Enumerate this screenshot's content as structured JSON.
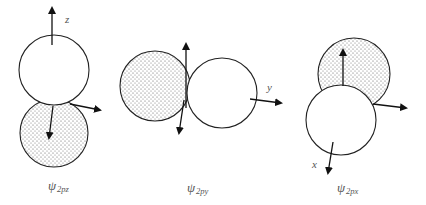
{
  "diagram": {
    "type": "p-orbital-lobes",
    "colors": {
      "stroke": "#222222",
      "fill_shaded": "#ffffff",
      "dots": "#555555",
      "label": "#555555",
      "background": "#ffffff"
    },
    "figures": [
      {
        "id": "psi-2pz",
        "caption": {
          "symbol": "ψ",
          "subscript": "2pz"
        },
        "axis_label": "z",
        "lobes": [
          {
            "cx": 54,
            "cy": 70,
            "r": 35,
            "shaded": false
          },
          {
            "cx": 54,
            "cy": 133,
            "r": 34,
            "shaded": true
          }
        ]
      },
      {
        "id": "psi-2py",
        "caption": {
          "symbol": "ψ",
          "subscript": "2py"
        },
        "axis_label": "y",
        "lobes": [
          {
            "cx": 155,
            "cy": 86,
            "r": 35,
            "shaded": true
          },
          {
            "cx": 222,
            "cy": 93,
            "r": 35,
            "shaded": false
          }
        ]
      },
      {
        "id": "psi-2px",
        "caption": {
          "symbol": "ψ",
          "subscript": "2px"
        },
        "axis_label": "x",
        "lobes": [
          {
            "cx": 354,
            "cy": 74,
            "r": 36,
            "shaded": true
          },
          {
            "cx": 341,
            "cy": 120,
            "r": 35,
            "shaded": false
          }
        ]
      }
    ]
  },
  "labels": {
    "fig1_axis": "z",
    "fig2_axis": "y",
    "fig3_axis": "x",
    "fig1_psi": "ψ",
    "fig1_sub": "2pz",
    "fig2_psi": "ψ",
    "fig2_sub": "2py",
    "fig3_psi": "ψ",
    "fig3_sub": "2px"
  }
}
